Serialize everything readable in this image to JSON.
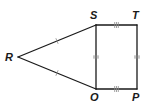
{
  "figure": {
    "type": "geometry",
    "vertices": {
      "R": {
        "label": "R"
      },
      "S": {
        "label": "S"
      },
      "T": {
        "label": "T"
      },
      "O": {
        "label": "O"
      },
      "P": {
        "label": "P"
      }
    },
    "segments": [
      {
        "name": "RS",
        "from": "R",
        "to": "S",
        "tick_marks": 1
      },
      {
        "name": "RO",
        "from": "R",
        "to": "O",
        "tick_marks": 1
      },
      {
        "name": "SO",
        "from": "S",
        "to": "O",
        "tick_marks": 2
      },
      {
        "name": "TP",
        "from": "T",
        "to": "P",
        "tick_marks": 2
      },
      {
        "name": "ST",
        "from": "S",
        "to": "T",
        "tick_marks": 3
      },
      {
        "name": "OP",
        "from": "O",
        "to": "P",
        "tick_marks": 3
      }
    ],
    "colors": {
      "line": "#1a1a1a",
      "tick": "#8a8a8a",
      "label": "#1a1a1a"
    }
  }
}
